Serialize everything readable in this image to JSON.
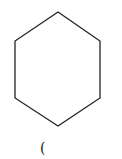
{
  "diagram": {
    "shape": "hexagon",
    "stroke_color": "#222222",
    "vertices": [
      [
        58,
        12
      ],
      [
        100,
        41
      ],
      [
        100,
        98
      ],
      [
        58,
        126
      ],
      [
        15,
        98
      ],
      [
        15,
        41
      ]
    ],
    "caption": "("
  }
}
